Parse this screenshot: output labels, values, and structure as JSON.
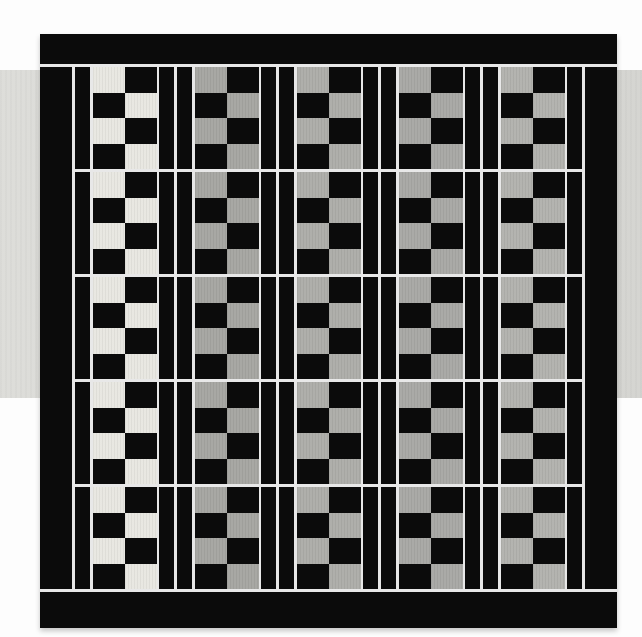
{
  "quilt": {
    "block_columns": 5,
    "block_rows": 5,
    "checker_cols_per_block": 2,
    "checker_rows_per_block": 4,
    "checker_phase": "light-top-left",
    "checker_colors": [
      "#e8e7e1",
      "#a6a6a2",
      "#adada9",
      "#a8a8a5",
      "#b2b2ae"
    ],
    "fabric_black": "#0b0b0b",
    "sashing_color": "#e8e8e8"
  },
  "background": {
    "page_color": "#fdfdfd",
    "band_color_left": "#f2f2f0",
    "band_color_right": "#e9e9e7"
  }
}
